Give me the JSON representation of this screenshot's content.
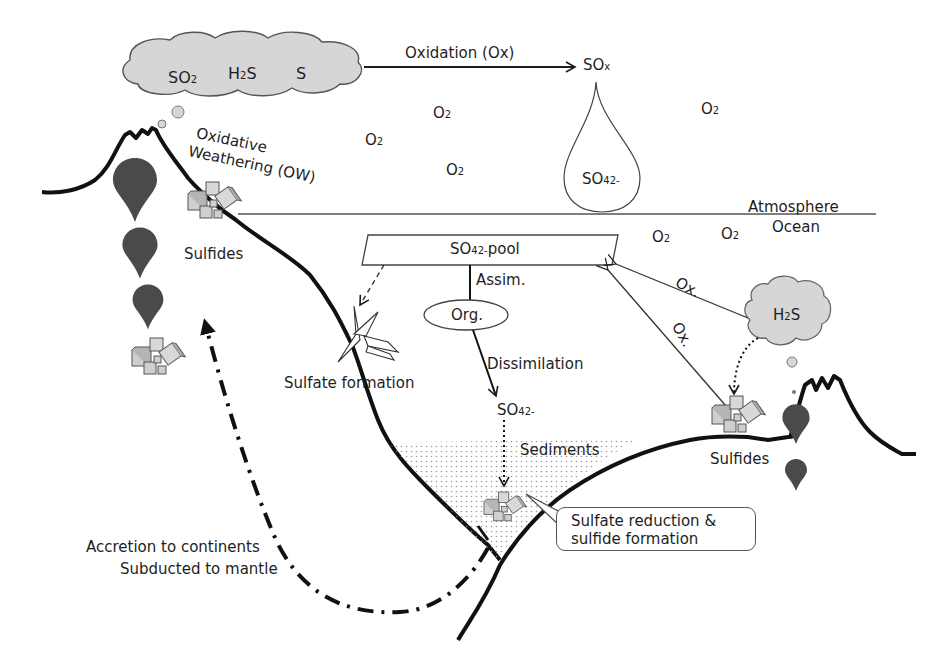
{
  "diagram": {
    "type": "biogeochemical-cycle",
    "topic": "sulfur cycle"
  },
  "atmosphere": {
    "volcanic_cloud": {
      "species": [
        {
          "base": "SO",
          "sub": "2"
        },
        {
          "base": "H",
          "sub": "2",
          "tail": "S"
        },
        {
          "base": "S"
        }
      ]
    },
    "oxidation_arrow_label": "Oxidation (Ox)",
    "sox": {
      "base": "SO",
      "sub": "x"
    },
    "sulfate_drop": {
      "base": "SO",
      "sub": "4",
      "sup": "2-"
    },
    "oxygen_labels": [
      {
        "base": "O",
        "sub": "2"
      },
      {
        "base": "O",
        "sub": "2"
      },
      {
        "base": "O",
        "sub": "2"
      },
      {
        "base": "O",
        "sub": "2"
      }
    ],
    "oxidative_weathering": [
      "Oxidative",
      "Weathering (OW)"
    ],
    "sulfides_left": "Sulfides"
  },
  "boundary": {
    "atmosphere_label": "Atmosphere",
    "ocean_label": "Ocean"
  },
  "ocean": {
    "oxygen_labels": [
      {
        "base": "O",
        "sub": "2"
      },
      {
        "base": "O",
        "sub": "2"
      }
    ],
    "pool": {
      "base": "SO",
      "sub": "4",
      "sup": "2-",
      "tail": " pool"
    },
    "assim_label": "Assim.",
    "org_label": "Org.",
    "dissimilation_label": "Dissimilation",
    "sulfate_dissolved": {
      "base": "SO",
      "sub": "4",
      "sup": "2-"
    },
    "sulfate_formation_label": "Sulfate formation",
    "hydrothermal_cloud": {
      "base": "H",
      "sub": "2",
      "tail": "S"
    },
    "ox_label_1": "Ox.",
    "ox_label_2": "Ox.",
    "sulfides_right": "Sulfides",
    "sediments_label": "Sediments",
    "callout": [
      "Sulfate reduction &",
      "sulfide formation"
    ]
  },
  "tectonics": {
    "labels": [
      "Accretion to continents",
      "Subducted to mantle"
    ]
  },
  "colors": {
    "ink": "#1e1e1e",
    "cloud_fill": "#d6d6d6",
    "magma": "#4a4a4a",
    "crystal_fill": "#cfcfcf",
    "sediment_dots": "#9a9a9a"
  }
}
